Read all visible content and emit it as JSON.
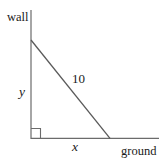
{
  "figure": {
    "type": "right-triangle-ladder-diagram",
    "background_color": "#ffffff",
    "stroke_color": "#666666",
    "text_color": "#1a1a1a",
    "labels": {
      "wall": "wall",
      "ground": "ground",
      "vertical_leg": "y",
      "horizontal_leg": "x",
      "hypotenuse": "10"
    },
    "geometry": {
      "wall_line": {
        "x1": 31,
        "y1": 10,
        "x2": 31,
        "y2": 139
      },
      "ground_line": {
        "x1": 31,
        "y1": 138,
        "x2": 159,
        "y2": 138
      },
      "hypotenuse_line": {
        "x1": 31,
        "y1": 40,
        "x2": 110,
        "y2": 138
      },
      "right_angle_marker": {
        "x": 31,
        "y": 128,
        "size": 10
      }
    }
  }
}
